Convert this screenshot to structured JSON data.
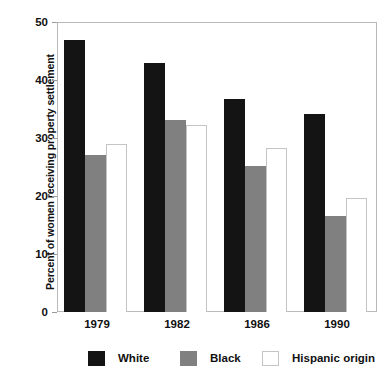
{
  "chart_data": {
    "type": "bar",
    "title": "",
    "xlabel": "",
    "ylabel": "Percent of women receiving property settlement",
    "categories": [
      "1979",
      "1982",
      "1986",
      "1990"
    ],
    "series": [
      {
        "name": "White",
        "color": "#141414",
        "values": [
          46.9,
          42.9,
          36.8,
          34.2
        ]
      },
      {
        "name": "Black",
        "color": "#808080",
        "values": [
          27.1,
          33.1,
          25.1,
          16.5
        ]
      },
      {
        "name": "Hispanic origin",
        "color": "#ffffff",
        "values": [
          29.0,
          32.2,
          28.3,
          19.7
        ]
      }
    ],
    "ylim": [
      0,
      50
    ],
    "yticks": [
      0,
      10,
      20,
      30,
      40,
      50
    ],
    "ytick_labels": [
      "0",
      "10",
      "20",
      "30",
      "40",
      "50"
    ],
    "grid": false,
    "legend_position": "bottom"
  },
  "axis": {
    "y_title": "Percent of women receiving property settlement"
  }
}
